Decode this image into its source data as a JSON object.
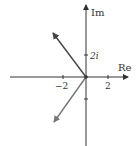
{
  "diagram": {
    "type": "complex-plane",
    "axes": {
      "real_label": "Re",
      "imag_label": "Im",
      "tick_labels": {
        "real_neg": "−2",
        "real_pos": "2",
        "imag_pos": "2i"
      }
    },
    "vectors": [
      {
        "name": "upper-left-vector",
        "from": [
          0,
          0
        ],
        "to": [
          -3,
          4
        ]
      },
      {
        "name": "lower-left-vector",
        "from": [
          0,
          0
        ],
        "to": [
          -3,
          -4
        ]
      }
    ],
    "colors": {
      "axis": "#333333",
      "upper_vector": "#444444",
      "lower_vector": "#777777"
    }
  }
}
